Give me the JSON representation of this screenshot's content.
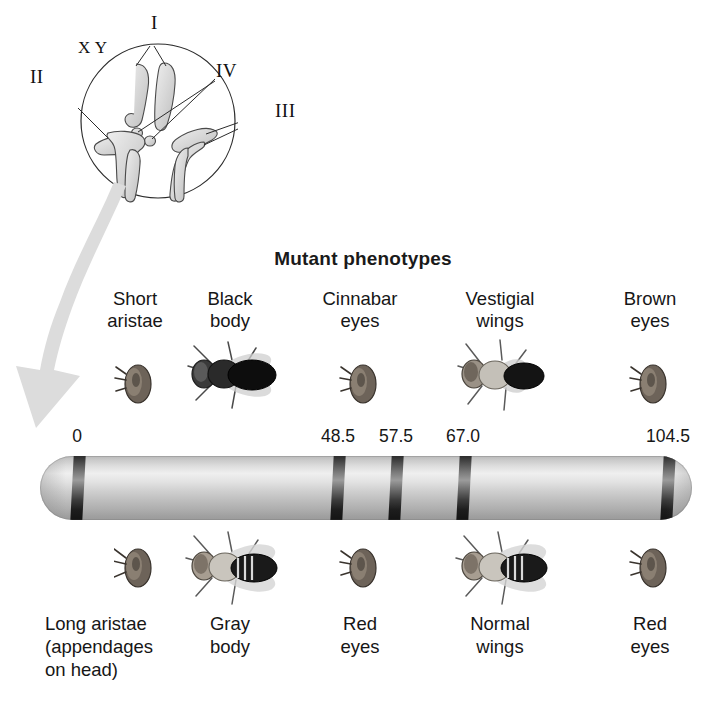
{
  "figure": {
    "title": "Mutant phenotypes",
    "karyotype": {
      "labels": [
        {
          "id": "I",
          "text": "I"
        },
        {
          "id": "II",
          "text": "II"
        },
        {
          "id": "III",
          "text": "III"
        },
        {
          "id": "IV",
          "text": "IV"
        },
        {
          "id": "X",
          "text": "X"
        },
        {
          "id": "Y",
          "text": "Y"
        }
      ]
    },
    "map": {
      "positions": [
        "0",
        "48.5",
        "57.5",
        "67.0",
        "104.5"
      ]
    },
    "columns": [
      {
        "mutant_line1": "Short",
        "mutant_line2": "aristae",
        "wild_line1": "Long aristae",
        "wild_line2": "(appendages",
        "wild_line3": "on head)",
        "position": "0",
        "mutant_fly": "fly-head-short-aristae",
        "wild_fly": "fly-head-long-aristae"
      },
      {
        "mutant_line1": "Black",
        "mutant_line2": "body",
        "wild_line1": "Gray",
        "wild_line2": "body",
        "wild_line3": "",
        "position": "48.5",
        "mutant_fly": "fly-black-body",
        "wild_fly": "fly-gray-body"
      },
      {
        "mutant_line1": "Cinnabar",
        "mutant_line2": "eyes",
        "wild_line1": "Red",
        "wild_line2": "eyes",
        "wild_line3": "",
        "position": "57.5",
        "mutant_fly": "fly-head-cinnabar-eyes",
        "wild_fly": "fly-head-red-eyes"
      },
      {
        "mutant_line1": "Vestigial",
        "mutant_line2": "wings",
        "wild_line1": "Normal",
        "wild_line2": "wings",
        "wild_line3": "",
        "position": "67.0",
        "mutant_fly": "fly-vestigial-wings",
        "wild_fly": "fly-normal-wings"
      },
      {
        "mutant_line1": "Brown",
        "mutant_line2": "eyes",
        "wild_line1": "Red",
        "wild_line2": "eyes",
        "wild_line3": "",
        "position": "104.5",
        "mutant_fly": "fly-head-brown-eyes",
        "wild_fly": "fly-head-red-eyes-2"
      }
    ],
    "colors": {
      "background": "#ffffff",
      "text": "#161616",
      "chromosome_light": "#efefef",
      "chromosome_dark": "#9a9a9a",
      "band": "#1d1d1d",
      "arrow": "#d8d8d8",
      "chromatid": "#d0d0d0"
    }
  }
}
